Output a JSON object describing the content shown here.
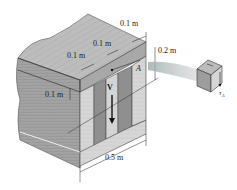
{
  "figure": {
    "type": "box-beam cross-section with shear stress element",
    "dimensions": {
      "top_right_width": "0.1 m",
      "top_middle_width": "0.1 m",
      "top_left_width": "0.1 m",
      "flange_thickness": "0.1 m",
      "height_section": "0.2 m",
      "base_width": "0.5 m"
    },
    "labels": {
      "point": "A",
      "shear_force": "V",
      "stress": "τ",
      "stress_sub": "A"
    },
    "colors": {
      "wood_top": "#b9b9b9",
      "wood_side": "#9c9c9c",
      "wood_light": "#d8d8d8",
      "outline": "#333333",
      "background": "#ffffff"
    }
  }
}
